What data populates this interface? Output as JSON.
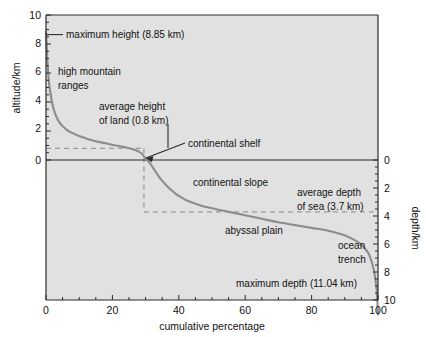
{
  "chart_data": {
    "type": "line",
    "title": "",
    "subtitle": "",
    "xlabel": "cumulative percentage",
    "ylabel": "altitude/km",
    "ylabel_right": "depth/km",
    "xlim": [
      0,
      100
    ],
    "ylim": [
      -11,
      10
    ],
    "ylim_right": [
      0,
      10
    ],
    "grid": false,
    "legend": "none",
    "background_color": "#e3e3e3",
    "curve_color": "#8c8c8c",
    "axis_color": "#2a2a2a",
    "dash_color": "#9a9a9a",
    "xticks": [
      0,
      20,
      40,
      60,
      80,
      100
    ],
    "xtick_labels": [
      "0",
      "20",
      "40",
      "60",
      "80",
      "100"
    ],
    "xminor_step": 5,
    "yticks_left": [
      0,
      2,
      4,
      6,
      8,
      10
    ],
    "ytick_labels_left": [
      "0",
      "2",
      "4",
      "6",
      "8",
      "10"
    ],
    "yticks_right": [
      0,
      2,
      4,
      6,
      8,
      10
    ],
    "ytick_labels_right": [
      "0",
      "2",
      "4",
      "6",
      "8",
      "10"
    ],
    "yminor_step": 0.5,
    "series": [
      {
        "name": "hypsographic curve",
        "x": [
          0.0,
          0.15,
          0.3,
          0.5,
          0.8,
          1.1,
          1.5,
          2.0,
          2.6,
          3.3,
          4.2,
          5.2,
          6.5,
          8.0,
          10.0,
          12.5,
          15.0,
          18.0,
          21.0,
          24.0,
          26.5,
          28.5,
          29.5,
          30.5,
          31.5,
          32.5,
          33.5,
          34.5,
          36.0,
          37.5,
          39.0,
          41.0,
          43.0,
          45.0,
          47.0,
          49.0,
          52.0,
          55.0,
          58.0,
          61.0,
          65.0,
          70.0,
          75.0,
          80.0,
          85.0,
          89.0,
          92.0,
          94.5,
          96.0,
          97.2,
          98.0,
          98.7,
          99.2,
          99.6,
          99.85,
          100.0
        ],
        "y": [
          8.85,
          8.2,
          7.4,
          6.5,
          5.6,
          5.0,
          4.4,
          3.8,
          3.3,
          2.9,
          2.55,
          2.3,
          2.05,
          1.85,
          1.65,
          1.45,
          1.3,
          1.15,
          1.0,
          0.87,
          0.72,
          0.5,
          0.25,
          0.0,
          -0.3,
          -0.65,
          -1.0,
          -1.35,
          -1.75,
          -2.1,
          -2.4,
          -2.7,
          -2.95,
          -3.12,
          -3.28,
          -3.4,
          -3.55,
          -3.7,
          -3.85,
          -4.0,
          -4.2,
          -4.45,
          -4.65,
          -4.85,
          -5.05,
          -5.3,
          -5.6,
          -5.95,
          -6.3,
          -6.7,
          -7.2,
          -7.8,
          -8.5,
          -9.3,
          -10.2,
          -11.04
        ]
      }
    ],
    "reference_lines": [
      {
        "name": "average-height-of-land",
        "orientation": "horizontal",
        "value": 0.8,
        "x_from": 0,
        "x_to": 29.5,
        "style": "dashed"
      },
      {
        "name": "continental-shelf-edge",
        "orientation": "vertical",
        "value": 29.5,
        "y_from": 0.8,
        "y_to": -3.7,
        "style": "dashed"
      },
      {
        "name": "average-depth-of-sea",
        "orientation": "horizontal",
        "value": -3.7,
        "x_from": 29.5,
        "x_to": 100,
        "style": "dashed"
      }
    ],
    "annotations": [
      {
        "name": "maximum-height",
        "text": "maximum height (8.85 km)",
        "x": 4.5,
        "y": 8.85,
        "leader": "horizontal"
      },
      {
        "name": "high-mountain-ranges",
        "text": "high mountain\nranges",
        "line1": "high mountain",
        "line2": "ranges",
        "x": 4.5,
        "y": 6.2,
        "leader": "none"
      },
      {
        "name": "average-height-of-land",
        "text": "average height\nof land (0.8 km)",
        "line1": "average height",
        "line2": "of land (0.8 km)",
        "x": 24.0,
        "y": 3.6,
        "leader": "vertical"
      },
      {
        "name": "continental-shelf",
        "text": "continental shelf",
        "x": 36.0,
        "y": 1.1,
        "leader": "arrow"
      },
      {
        "name": "continental-slope",
        "text": "continental slope",
        "x": 45.0,
        "y": -1.3,
        "leader": "none"
      },
      {
        "name": "average-depth-of-sea",
        "text": "average depth\nof sea (3.7 km)",
        "line1": "average depth",
        "line2": "of sea (3.7 km)",
        "x": 76.0,
        "y": -2.4,
        "leader": "none"
      },
      {
        "name": "abyssal-plain",
        "text": "abyssal plain",
        "x": 66.0,
        "y": -5.0,
        "leader": "none"
      },
      {
        "name": "ocean-trench",
        "text": "ocean\ntrench",
        "line1": "ocean",
        "line2": "trench",
        "x": 91.0,
        "y": -6.2,
        "leader": "none"
      },
      {
        "name": "maximum-depth",
        "text": "maximum depth (11.04 km)",
        "x": 76.0,
        "y": -8.9,
        "leader": "none"
      }
    ]
  },
  "labels": {
    "x_axis_title": "cumulative percentage",
    "y_axis_title_left": "altitude/km",
    "y_axis_title_right": "depth/km",
    "xtick_0": "0",
    "xtick_1": "20",
    "xtick_2": "40",
    "xtick_3": "60",
    "xtick_4": "80",
    "xtick_5": "100",
    "ytick_left_0": "10",
    "ytick_left_1": "8",
    "ytick_left_2": "6",
    "ytick_left_3": "4",
    "ytick_left_4": "2",
    "ytick_left_5": "0",
    "ytick_right_0": "0",
    "ytick_right_1": "2",
    "ytick_right_2": "4",
    "ytick_right_3": "6",
    "ytick_right_4": "8",
    "ytick_right_5": "10",
    "annot_max_height": "maximum height (8.85 km)",
    "annot_mountain_l1": "high mountain",
    "annot_mountain_l2": "ranges",
    "annot_avg_land_l1": "average height",
    "annot_avg_land_l2": "of land (0.8 km)",
    "annot_shelf": "continental shelf",
    "annot_slope": "continental slope",
    "annot_avg_sea_l1": "average depth",
    "annot_avg_sea_l2": "of sea (3.7 km)",
    "annot_abyssal": "abyssal plain",
    "annot_trench_l1": "ocean",
    "annot_trench_l2": "trench",
    "annot_max_depth": "maximum depth (11.04 km)"
  }
}
